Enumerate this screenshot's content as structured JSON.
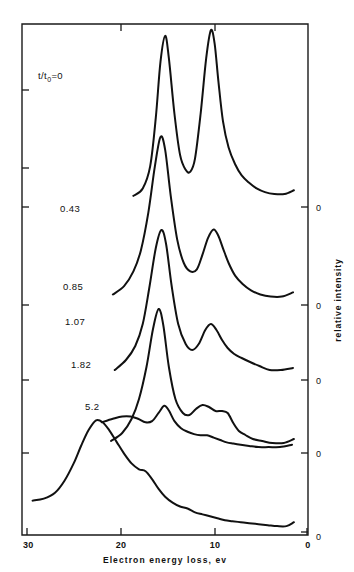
{
  "figure": {
    "name": "electron-energy-loss-spectra",
    "background_color": "#ffffff",
    "line_color": "#111111"
  },
  "axes": {
    "x_title": "Electron energy loss, ev",
    "y_title": "relative intensity",
    "x_ticks": [
      "30",
      "20",
      "10",
      "0"
    ],
    "x_tick_values": [
      30,
      20,
      10,
      0
    ],
    "x_reversed": true,
    "zero_markers": [
      "0",
      "0",
      "0",
      "0",
      "0"
    ]
  },
  "curve_labels": {
    "first": "t/t",
    "first_sub": "0",
    "first_eq": "=0",
    "items": [
      "0.43",
      "0.85",
      "1.07",
      "1.82",
      "5.2"
    ]
  },
  "chart_data": {
    "type": "line",
    "title": "",
    "subtitle": "",
    "xlabel": "Electron energy loss, ev",
    "ylabel": "relative intensity",
    "xlim": [
      30,
      0
    ],
    "x_axis_reversed": true,
    "ylim": [
      0,
      1
    ],
    "grid": false,
    "legend_position": "inline-left-of-each-curve",
    "annotations": [
      {
        "text": "t/t0=0",
        "x": 26.5,
        "y_curve": 0
      },
      {
        "text": "0.43",
        "x": 24.0,
        "y_curve": 1
      },
      {
        "text": "0.85",
        "x": 24.0,
        "y_curve": 2
      },
      {
        "text": "1.07",
        "x": 23.5,
        "y_curve": 3
      },
      {
        "text": "1.82",
        "x": 24.0,
        "y_curve": 4
      },
      {
        "text": "5.2",
        "x": 22.5,
        "y_curve": 5
      }
    ],
    "series": [
      {
        "name": "t/t0=0",
        "baseline_label": "0",
        "x": [
          18.6,
          17.6,
          16.8,
          16.2,
          15.7,
          15.2,
          14.8,
          14.2,
          13.6,
          13.0,
          12.5,
          12.0,
          11.4,
          10.8,
          10.3,
          9.9,
          9.5,
          9.0,
          8.4,
          7.7,
          7.0,
          6.2,
          5.4,
          4.5,
          3.5,
          2.4,
          1.4
        ],
        "y": [
          0.06,
          0.1,
          0.22,
          0.48,
          0.78,
          0.92,
          0.8,
          0.5,
          0.28,
          0.2,
          0.19,
          0.26,
          0.5,
          0.8,
          0.95,
          0.88,
          0.68,
          0.46,
          0.32,
          0.23,
          0.17,
          0.13,
          0.1,
          0.08,
          0.07,
          0.07,
          0.09
        ]
      },
      {
        "name": "0.43",
        "baseline_label": "0",
        "x": [
          20.8,
          19.6,
          18.6,
          17.8,
          17.0,
          16.3,
          15.7,
          15.2,
          14.6,
          13.9,
          13.2,
          12.5,
          11.8,
          11.2,
          10.6,
          10.0,
          9.5,
          9.0,
          8.4,
          7.7,
          6.9,
          6.0,
          5.0,
          3.9,
          2.7,
          1.5
        ],
        "y": [
          0.05,
          0.09,
          0.16,
          0.26,
          0.44,
          0.66,
          0.8,
          0.74,
          0.52,
          0.31,
          0.2,
          0.16,
          0.17,
          0.24,
          0.32,
          0.36,
          0.33,
          0.27,
          0.2,
          0.14,
          0.1,
          0.07,
          0.05,
          0.04,
          0.04,
          0.06
        ]
      },
      {
        "name": "0.85",
        "baseline_label": "0",
        "x": [
          20.6,
          19.4,
          18.4,
          17.6,
          16.9,
          16.2,
          15.6,
          15.1,
          14.5,
          13.8,
          13.0,
          12.3,
          11.6,
          10.9,
          10.3,
          9.7,
          9.1,
          8.5,
          7.8,
          7.0,
          6.1,
          5.1,
          4.0,
          2.8,
          1.5
        ],
        "y": [
          0.05,
          0.1,
          0.17,
          0.28,
          0.46,
          0.66,
          0.75,
          0.68,
          0.47,
          0.28,
          0.18,
          0.15,
          0.18,
          0.25,
          0.28,
          0.25,
          0.2,
          0.16,
          0.13,
          0.11,
          0.09,
          0.07,
          0.05,
          0.05,
          0.06
        ]
      },
      {
        "name": "1.07",
        "baseline_label": "0",
        "x": [
          21.0,
          19.8,
          18.8,
          18.0,
          17.2,
          16.5,
          15.9,
          15.4,
          14.8,
          14.1,
          13.3,
          12.6,
          11.9,
          11.2,
          10.5,
          9.8,
          9.1,
          8.5,
          7.9,
          7.3,
          6.6,
          5.8,
          4.8,
          3.7,
          2.5,
          1.4
        ],
        "y": [
          0.06,
          0.1,
          0.17,
          0.27,
          0.43,
          0.62,
          0.72,
          0.64,
          0.43,
          0.27,
          0.2,
          0.19,
          0.22,
          0.24,
          0.23,
          0.21,
          0.21,
          0.2,
          0.15,
          0.11,
          0.09,
          0.07,
          0.06,
          0.05,
          0.05,
          0.07
        ]
      },
      {
        "name": "1.82",
        "baseline_label": "0",
        "x": [
          22.0,
          20.8,
          19.8,
          18.9,
          18.1,
          17.3,
          16.6,
          15.9,
          15.3,
          14.8,
          14.2,
          13.5,
          12.8,
          12.1,
          11.4,
          10.7,
          10.0,
          9.3,
          8.6,
          7.9,
          7.1,
          6.2,
          5.2,
          4.1,
          2.9,
          1.6
        ],
        "y": [
          0.26,
          0.29,
          0.31,
          0.31,
          0.29,
          0.26,
          0.27,
          0.34,
          0.4,
          0.36,
          0.27,
          0.21,
          0.18,
          0.16,
          0.15,
          0.15,
          0.13,
          0.11,
          0.09,
          0.08,
          0.07,
          0.06,
          0.05,
          0.05,
          0.05,
          0.07
        ]
      },
      {
        "name": "5.2",
        "baseline_label": "0",
        "x": [
          29.4,
          28.2,
          27.0,
          26.0,
          25.0,
          24.2,
          23.4,
          22.6,
          21.9,
          21.2,
          20.4,
          19.6,
          18.8,
          18.0,
          17.3,
          16.6,
          15.9,
          15.2,
          14.4,
          13.6,
          12.8,
          12.0,
          11.2,
          10.4,
          9.6,
          8.8,
          8.0,
          7.1,
          6.2,
          5.2,
          4.2,
          3.2,
          2.2,
          1.4
        ],
        "y": [
          0.16,
          0.17,
          0.2,
          0.26,
          0.35,
          0.44,
          0.52,
          0.57,
          0.56,
          0.52,
          0.46,
          0.4,
          0.35,
          0.32,
          0.31,
          0.27,
          0.22,
          0.18,
          0.15,
          0.13,
          0.12,
          0.1,
          0.09,
          0.08,
          0.07,
          0.06,
          0.055,
          0.05,
          0.045,
          0.04,
          0.035,
          0.03,
          0.03,
          0.05
        ]
      }
    ]
  }
}
